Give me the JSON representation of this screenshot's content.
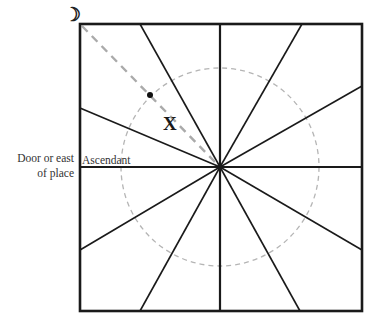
{
  "diagram": {
    "type": "square-chart-with-radiating-houses",
    "moon_symbol": "☽",
    "labels": {
      "door_line1": "Door or east",
      "door_line2": "of place",
      "ascendant": "Ascendant",
      "marker": "X"
    },
    "colors": {
      "lines": "#1a1a1a",
      "dashed_line": "#aaaaaa",
      "dashed_circle": "#b5b5b5",
      "text": "#333333",
      "background": "#ffffff"
    },
    "geometry": {
      "box": {
        "x1": 80,
        "y1": 24,
        "x2": 362,
        "y2": 311
      },
      "center": {
        "x": 220,
        "y": 167
      },
      "circle_radius": 99,
      "dot": {
        "x": 150,
        "y": 95
      }
    }
  }
}
